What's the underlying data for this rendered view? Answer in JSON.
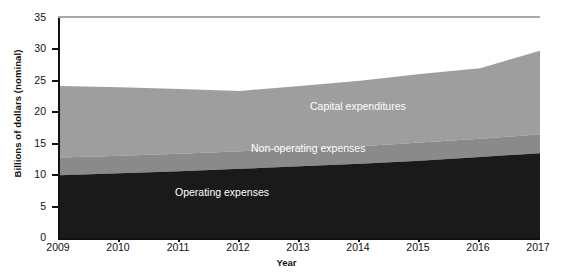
{
  "chart_data": {
    "type": "area",
    "stacked": true,
    "title": "",
    "xlabel": "Year",
    "ylabel": "Billions of dollars (nominal)",
    "x": [
      2009,
      2010,
      2011,
      2012,
      2013,
      2014,
      2015,
      2016,
      2017
    ],
    "xtick_labels": [
      "2009",
      "2010",
      "2011",
      "2012",
      "2013",
      "2014",
      "2015",
      "2016",
      "2017"
    ],
    "ytick_labels": [
      "0",
      "5",
      "10",
      "15",
      "20",
      "25",
      "30",
      "35"
    ],
    "ytick_values": [
      0,
      5,
      10,
      15,
      20,
      25,
      30,
      35
    ],
    "xlim": [
      2009,
      2017
    ],
    "ylim": [
      0,
      35
    ],
    "grid": false,
    "legend_position": "inline-labels",
    "series": [
      {
        "name": "Operating expenses",
        "color": "#1a1a1a",
        "label_color": "#ffffff",
        "values": [
          10.0,
          10.3,
          10.6,
          11.0,
          11.4,
          11.8,
          12.3,
          12.9,
          13.5
        ]
      },
      {
        "name": "Non-operating expenses",
        "color": "#8a8a8a",
        "label_color": "#ffffff",
        "values": [
          2.8,
          2.8,
          2.8,
          2.8,
          2.8,
          2.8,
          2.9,
          2.9,
          3.0
        ]
      },
      {
        "name": "Capital expenditures",
        "color": "#9e9e9e",
        "label_color": "#ffffff",
        "values": [
          11.4,
          10.9,
          10.3,
          9.6,
          10.0,
          10.4,
          10.9,
          11.2,
          13.3
        ]
      }
    ],
    "cumulative_tops": {
      "operating": [
        10.0,
        10.3,
        10.6,
        11.0,
        11.4,
        11.8,
        12.3,
        12.9,
        13.5
      ],
      "non_operating": [
        12.8,
        13.1,
        13.4,
        13.8,
        14.2,
        14.6,
        15.2,
        15.8,
        16.5
      ],
      "capital": [
        24.2,
        24.0,
        23.7,
        23.4,
        24.2,
        25.0,
        26.1,
        27.0,
        29.8
      ]
    }
  },
  "axis": {
    "y_title": "Billions of dollars (nominal)",
    "x_title": "Year"
  },
  "labels": {
    "capital": "Capital expenditures",
    "non_operating": "Non-operating expenses",
    "operating": "Operating expenses"
  }
}
